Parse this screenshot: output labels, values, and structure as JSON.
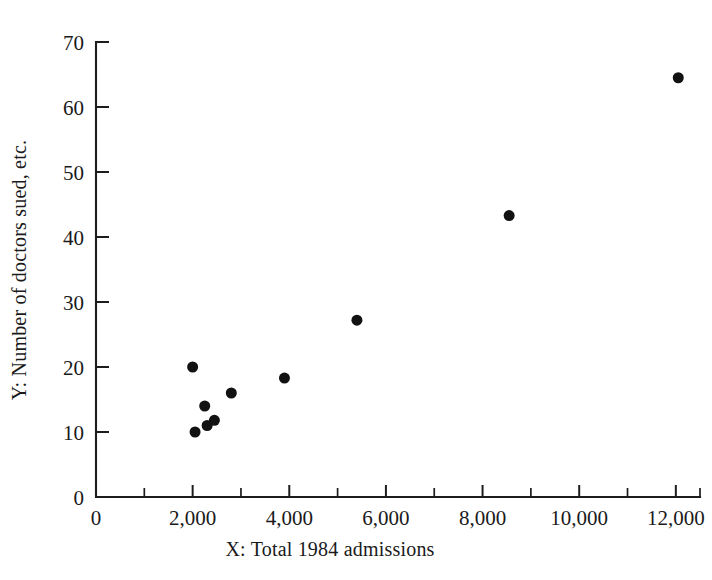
{
  "chart_data": {
    "type": "scatter",
    "title": "",
    "subtitle": "",
    "xlabel": "X:   Total 1984 admissions",
    "ylabel": "Y:   Number of doctors sued, etc.",
    "xlim": [
      0,
      12500
    ],
    "ylim": [
      0,
      70
    ],
    "grid": false,
    "legend": null,
    "x_ticks": [
      0,
      2000,
      4000,
      6000,
      8000,
      10000,
      12000
    ],
    "x_tick_labels": [
      "0",
      "2,000",
      "4,000",
      "6,000",
      "8,000",
      "10,000",
      "12,000"
    ],
    "x_minor_ticks": [
      1000,
      3000,
      5000,
      7000,
      9000,
      11000,
      12500
    ],
    "y_ticks": [
      0,
      10,
      20,
      30,
      40,
      50,
      60,
      70
    ],
    "y_tick_labels": [
      "0",
      "10",
      "20",
      "30",
      "40",
      "50",
      "60",
      "70"
    ],
    "y_minor_ticks": [],
    "marker": "filled-circle",
    "marker_color": "#121212",
    "marker_size": 11,
    "points": [
      {
        "x": 2000,
        "y": 20.0
      },
      {
        "x": 2050,
        "y": 10.0
      },
      {
        "x": 2250,
        "y": 14.0
      },
      {
        "x": 2300,
        "y": 11.0
      },
      {
        "x": 2450,
        "y": 11.8
      },
      {
        "x": 2800,
        "y": 16.0
      },
      {
        "x": 3900,
        "y": 18.3
      },
      {
        "x": 5400,
        "y": 27.2
      },
      {
        "x": 8550,
        "y": 43.3
      },
      {
        "x": 12050,
        "y": 64.5
      }
    ]
  },
  "axes": {
    "x_axis_name": "x-axis",
    "y_axis_name": "y-axis"
  }
}
